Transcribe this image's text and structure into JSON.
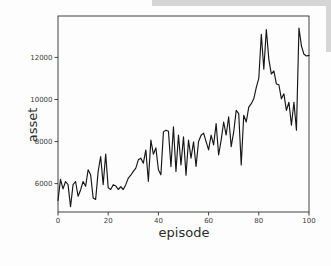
{
  "window": {
    "background": "#fdfdfd"
  },
  "artifacts": {
    "top_strip_color": "#d5d5d5",
    "right_strip_color": "#d6d6d6"
  },
  "chart_data": {
    "type": "line",
    "title": "",
    "xlabel": "episode",
    "ylabel": "asset",
    "x_ticks": [
      0,
      20,
      40,
      60,
      80,
      100
    ],
    "y_ticks": [
      6000,
      8000,
      10000,
      12000
    ],
    "xlim": [
      0,
      100
    ],
    "ylim": [
      4650,
      13970
    ],
    "grid": false,
    "legend": "none",
    "line_color": "#161616",
    "spine_color": "#2e2e2e",
    "x": [
      0,
      1,
      2,
      3,
      4,
      5,
      6,
      7,
      8,
      9,
      10,
      11,
      12,
      13,
      14,
      15,
      16,
      17,
      18,
      19,
      20,
      21,
      22,
      23,
      24,
      25,
      26,
      27,
      28,
      29,
      30,
      31,
      32,
      33,
      34,
      35,
      36,
      37,
      38,
      39,
      40,
      41,
      42,
      43,
      44,
      45,
      46,
      47,
      48,
      49,
      50,
      51,
      52,
      53,
      54,
      55,
      56,
      57,
      58,
      59,
      60,
      61,
      62,
      63,
      64,
      65,
      66,
      67,
      68,
      69,
      70,
      71,
      72,
      73,
      74,
      75,
      76,
      77,
      78,
      79,
      80,
      81,
      82,
      83,
      84,
      85,
      86,
      87,
      88,
      89,
      90,
      91,
      92,
      93,
      94,
      95,
      96,
      97,
      98,
      99,
      100
    ],
    "series": [
      {
        "name": "asset",
        "values": [
          5200,
          6200,
          5750,
          6100,
          5950,
          4900,
          5950,
          6100,
          5400,
          5700,
          6100,
          5870,
          6660,
          6420,
          5320,
          5250,
          6580,
          7290,
          5950,
          7410,
          5800,
          5720,
          5950,
          5890,
          5720,
          5850,
          5720,
          5950,
          6260,
          6400,
          6580,
          6740,
          7130,
          7210,
          6970,
          7600,
          6110,
          8070,
          7400,
          7700,
          6660,
          6420,
          8460,
          8540,
          8490,
          6810,
          8700,
          6580,
          8310,
          6890,
          8230,
          6400,
          8070,
          7210,
          7990,
          6820,
          8000,
          8300,
          8400,
          8000,
          7600,
          8310,
          7840,
          8860,
          7360,
          8070,
          8930,
          8310,
          9170,
          7760,
          8460,
          9480,
          9330,
          6890,
          9250,
          8930,
          9640,
          9800,
          10030,
          10580,
          11000,
          13100,
          11440,
          13330,
          11910,
          11210,
          11360,
          10740,
          10700,
          10030,
          10270,
          9480,
          9870,
          8780,
          9870,
          8540,
          13400,
          12540,
          12150,
          12070,
          12100
        ]
      }
    ]
  }
}
